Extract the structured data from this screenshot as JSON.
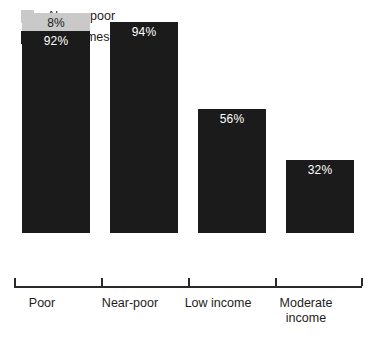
{
  "legend": {
    "items": [
      {
        "label": "Always poor",
        "color": "#c9c9c9",
        "icon": "legend-swatch-gray"
      },
      {
        "label": "Sometimes poor",
        "color": "#1b1b1b",
        "icon": "legend-swatch-black"
      }
    ]
  },
  "chart_data": {
    "type": "bar",
    "stacked": true,
    "title": "",
    "subtitle": "",
    "xlabel": "",
    "ylabel": "",
    "ylim": [
      0,
      100
    ],
    "grid": false,
    "legend_position": "top-left",
    "categories": [
      "Poor",
      "Near-poor",
      "Low income",
      "Moderate income"
    ],
    "category_lines": [
      [
        "Poor"
      ],
      [
        "Near-poor"
      ],
      [
        "Low",
        "income"
      ],
      [
        "Moderate",
        "income"
      ]
    ],
    "series": [
      {
        "name": "Sometimes poor",
        "color": "#1b1b1b",
        "values": [
          92,
          94,
          56,
          32
        ],
        "value_labels": [
          "92%",
          "94%",
          "56%",
          "32%"
        ]
      },
      {
        "name": "Always poor",
        "color": "#c9c9c9",
        "values": [
          8,
          0,
          0,
          0
        ],
        "value_labels": [
          "8%",
          "",
          "",
          ""
        ]
      }
    ],
    "totals": [
      100,
      94,
      56,
      32
    ]
  },
  "bars": [
    {
      "category": "Poor",
      "dark_label": "92%",
      "gray_label": "8%",
      "dark_pct": 92,
      "gray_pct": 8,
      "left": 22,
      "width": 68,
      "dark_height": 202,
      "gray_height": 18
    },
    {
      "category": "Near-poor",
      "dark_label": "94%",
      "gray_label": "",
      "dark_pct": 94,
      "gray_pct": 0,
      "left": 110,
      "width": 68,
      "dark_height": 211,
      "gray_height": 0
    },
    {
      "category": "Low income",
      "dark_label": "56%",
      "gray_label": "",
      "dark_pct": 56,
      "gray_pct": 0,
      "left": 198,
      "width": 68,
      "dark_height": 124,
      "gray_height": 0
    },
    {
      "category": "Moderate income",
      "dark_label": "32%",
      "gray_label": "",
      "dark_pct": 32,
      "gray_pct": 0,
      "left": 286,
      "width": 68,
      "dark_height": 73,
      "gray_height": 0
    }
  ],
  "axis": {
    "tick_positions": [
      0,
      87,
      174,
      261,
      347
    ]
  },
  "category_labels": [
    {
      "lines": [
        "Poor"
      ],
      "center": 42
    },
    {
      "lines": [
        "Near-poor"
      ],
      "center": 130
    },
    {
      "lines": [
        "Low income"
      ],
      "center": 218
    },
    {
      "lines": [
        "Moderate",
        "income"
      ],
      "center": 306
    }
  ]
}
